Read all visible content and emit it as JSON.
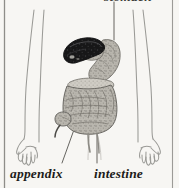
{
  "figure": {
    "background_color": "#f7f6f3",
    "width": 179,
    "height": 188
  },
  "labels": {
    "stomach": "stomach",
    "appendix": "appendix",
    "intestine": "intestine"
  },
  "colors": {
    "background": "#f7f6f3",
    "body_outline": "#9a9a96",
    "border_rule": "#8e8d89",
    "liver_dark": "#1a1a1c",
    "organ_mid": "#9d9b94",
    "organ_light": "#cfccc4",
    "organ_shadow": "#6e6c66",
    "label_text": "#1d1c1a",
    "leader_line": "#55534f"
  },
  "structures": [
    {
      "name": "left-arm",
      "description": "outline of left arm with hand and splayed fingers"
    },
    {
      "name": "right-arm",
      "description": "outline of right arm with hand and splayed fingers"
    },
    {
      "name": "liver",
      "description": "dark elongated liver lobe at upper left of organ mass"
    },
    {
      "name": "stomach",
      "description": "gray curved stomach and duodenum arching to the right"
    },
    {
      "name": "large-intestine",
      "description": "textured convoluted intestinal mass filling the lower abdomen"
    },
    {
      "name": "appendix",
      "description": "small projection at lower left of the intestinal mass"
    }
  ],
  "leader_lines": [
    {
      "name": "stomach-leader",
      "from": "stomach label",
      "to": "stomach organ"
    },
    {
      "name": "appendix-leader",
      "from": "appendix label",
      "to": "appendix structure"
    },
    {
      "name": "intestine-leader",
      "from": "intestine label",
      "to": "intestinal mass"
    }
  ]
}
